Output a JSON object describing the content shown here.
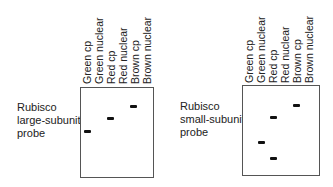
{
  "panels": [
    {
      "probe_label_lines": [
        "Rubisco",
        "large-subunit",
        "probe"
      ],
      "lanes": [
        "Green cp",
        "Green nuclear",
        "Red cp",
        "Red nuclear",
        "Brown cp",
        "Brown nuclear"
      ],
      "bands": [
        {
          "lane": "Green cp",
          "lane_index": 0,
          "y": 131
        },
        {
          "lane": "Red cp",
          "lane_index": 2,
          "y": 118
        },
        {
          "lane": "Brown cp",
          "lane_index": 4,
          "y": 106
        }
      ]
    },
    {
      "probe_label_lines": [
        "Rubisco",
        "small-subunit",
        "probe"
      ],
      "lanes": [
        "Green cp",
        "Green nuclear",
        "Red cp",
        "Red nuclear",
        "Brown cp",
        "Brown nuclear"
      ],
      "bands": [
        {
          "lane": "Brown cp",
          "lane_index": 4,
          "y": 105
        },
        {
          "lane": "Red cp",
          "lane_index": 2,
          "y": 117
        },
        {
          "lane": "Green nuclear",
          "lane_index": 1,
          "y": 142
        },
        {
          "lane": "Red cp",
          "lane_index": 2,
          "y": 158
        }
      ]
    }
  ]
}
